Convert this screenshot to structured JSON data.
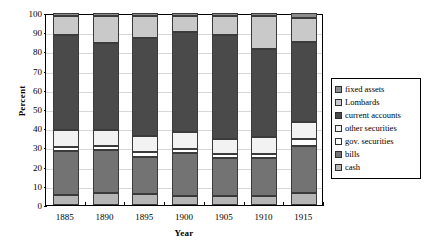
{
  "chart_data": {
    "type": "bar",
    "subtype": "stacked-percentage-column",
    "title": "",
    "xlabel": "Year",
    "ylabel": "Percent",
    "categories": [
      "1885",
      "1890",
      "1895",
      "1900",
      "1905",
      "1910",
      "1915"
    ],
    "ylim": [
      0,
      100
    ],
    "yticks": [
      0,
      10,
      20,
      30,
      40,
      50,
      60,
      70,
      80,
      90,
      100
    ],
    "ytick_labels": [
      "0",
      "10",
      "20",
      "30",
      "40",
      "50",
      "60",
      "70",
      "80",
      "90",
      "100"
    ],
    "grid": true,
    "grid_axis": "y",
    "legend_position": "right",
    "stack_order_bottom_to_top": [
      "cash",
      "bills",
      "gov. securities",
      "other securities",
      "current accounts",
      "Lombards",
      "fixed assets"
    ],
    "series": [
      {
        "name": "fixed assets",
        "color": "#8c8c8c",
        "values": [
          1.5,
          1.5,
          1.5,
          1.5,
          1.5,
          1.5,
          2.5
        ]
      },
      {
        "name": "Lombards",
        "color": "#c9c9c9",
        "values": [
          10.0,
          14.0,
          11.5,
          8.5,
          10.0,
          17.0,
          12.5
        ]
      },
      {
        "name": "current accounts",
        "color": "#4a4a4a",
        "values": [
          49.5,
          45.5,
          51.0,
          52.0,
          54.0,
          46.0,
          42.0
        ]
      },
      {
        "name": "other securities",
        "color": "#f2f2f2",
        "values": [
          9.0,
          8.5,
          8.5,
          9.0,
          8.0,
          9.0,
          8.5
        ]
      },
      {
        "name": "gov. securities",
        "color": "#ffffff",
        "values": [
          2.0,
          2.0,
          2.5,
          2.0,
          2.0,
          2.0,
          4.0
        ]
      },
      {
        "name": "bills",
        "color": "#737373",
        "values": [
          23.0,
          22.5,
          19.5,
          22.5,
          20.0,
          20.0,
          24.0
        ]
      },
      {
        "name": "cash",
        "color": "#b5b5b5",
        "values": [
          5.0,
          6.0,
          5.5,
          4.5,
          4.5,
          4.5,
          6.5
        ]
      }
    ],
    "cumulative_tops_bottom_to_top": {
      "1885": {
        "cash": 5.0,
        "bills": 28.0,
        "gov. securities": 30.0,
        "other securities": 39.0,
        "current accounts": 88.5,
        "Lombards": 98.5,
        "fixed assets": 100
      },
      "1890": {
        "cash": 6.0,
        "bills": 28.5,
        "gov. securities": 30.5,
        "other securities": 39.0,
        "current accounts": 84.5,
        "Lombards": 98.5,
        "fixed assets": 100
      },
      "1895": {
        "cash": 5.5,
        "bills": 25.0,
        "gov. securities": 27.5,
        "other securities": 36.0,
        "current accounts": 87.0,
        "Lombards": 98.5,
        "fixed assets": 100
      },
      "1900": {
        "cash": 4.5,
        "bills": 27.0,
        "gov. securities": 29.0,
        "other securities": 38.0,
        "current accounts": 90.0,
        "Lombards": 98.5,
        "fixed assets": 100
      },
      "1905": {
        "cash": 4.5,
        "bills": 24.5,
        "gov. securities": 26.5,
        "other securities": 34.5,
        "current accounts": 88.5,
        "Lombards": 98.5,
        "fixed assets": 100
      },
      "1910": {
        "cash": 4.5,
        "bills": 24.5,
        "gov. securities": 26.5,
        "other securities": 35.5,
        "current accounts": 81.5,
        "Lombards": 98.5,
        "fixed assets": 100
      },
      "1915": {
        "cash": 6.5,
        "bills": 30.5,
        "gov. securities": 34.5,
        "other securities": 43.0,
        "current accounts": 85.0,
        "Lombards": 97.5,
        "fixed assets": 100
      }
    }
  },
  "legend": {
    "items": [
      {
        "label": "fixed assets",
        "color": "#8c8c8c"
      },
      {
        "label": "Lombards",
        "color": "#c9c9c9"
      },
      {
        "label": "current accounts",
        "color": "#4a4a4a"
      },
      {
        "label": "other securities",
        "color": "#f2f2f2"
      },
      {
        "label": "gov. securities",
        "color": "#ffffff"
      },
      {
        "label": "bills",
        "color": "#737373"
      },
      {
        "label": "cash",
        "color": "#b5b5b5"
      }
    ]
  },
  "axes": {
    "y_title": "Percent",
    "x_title": "Year"
  }
}
